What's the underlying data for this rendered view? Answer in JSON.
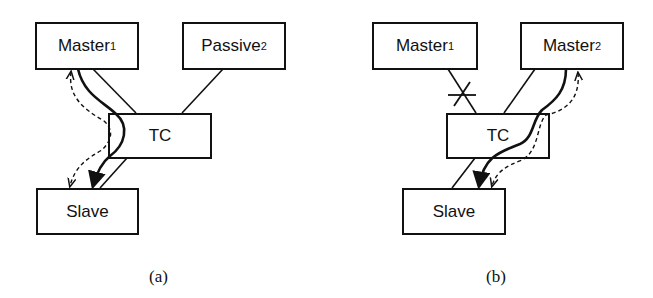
{
  "panels": [
    {
      "caption": "(a)",
      "nodes": {
        "master1": {
          "label": "Master",
          "sub": "1"
        },
        "passive2": {
          "label": "Passive",
          "sub": "2"
        },
        "tc": {
          "label": "TC"
        },
        "slave": {
          "label": "Slave"
        }
      },
      "edges": [
        "Master1-TC",
        "Passive2-TC",
        "TC-Slave"
      ],
      "flows": [
        {
          "type": "solid-thick",
          "from": "Master1",
          "to": "Slave",
          "via": "TC"
        },
        {
          "type": "dashed",
          "from": "Slave",
          "to": "Master1",
          "via": "TC",
          "bidirectional": true
        }
      ]
    },
    {
      "caption": "(b)",
      "nodes": {
        "master1": {
          "label": "Master",
          "sub": "1"
        },
        "master2": {
          "label": "Master",
          "sub": "2"
        },
        "tc": {
          "label": "TC"
        },
        "slave": {
          "label": "Slave"
        }
      },
      "edges": [
        "Master1-TC (broken)",
        "Master2-TC",
        "TC-Slave"
      ],
      "flows": [
        {
          "type": "solid-thick",
          "from": "Master2",
          "to": "Slave",
          "via": "TC"
        },
        {
          "type": "dashed",
          "from": "Slave",
          "to": "Master2",
          "via": "TC",
          "bidirectional": true
        }
      ]
    }
  ]
}
